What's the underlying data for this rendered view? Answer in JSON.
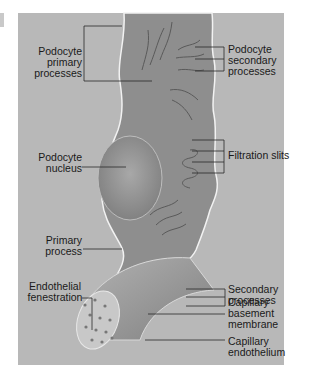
{
  "figure": {
    "type": "anatomical-diagram",
    "colors": {
      "background": "#b8b8b8",
      "cell": "#8e8e8e",
      "cell_dark": "#6a6a6a",
      "capillary": "#9a9a9a",
      "outline": "#f2f2f2",
      "text": "#1a1a1a"
    }
  },
  "labels": {
    "podocyte_primary_processes": [
      "Podocyte",
      "primary",
      "processes"
    ],
    "podocyte_secondary_processes": [
      "Podocyte",
      "secondary",
      "processes"
    ],
    "podocyte_nucleus": [
      "Podocyte",
      "nucleus"
    ],
    "filtration_slits": [
      "Filtration slits"
    ],
    "primary_process": [
      "Primary",
      "process"
    ],
    "secondary_processes": [
      "Secondary",
      "processes"
    ],
    "endothelial_fenestration": [
      "Endothelial",
      "fenestration"
    ],
    "capillary_basement_membrane": [
      "Capillary",
      "basement",
      "membrane"
    ],
    "capillary_endothelium": [
      "Capillary",
      "endothelium"
    ]
  }
}
